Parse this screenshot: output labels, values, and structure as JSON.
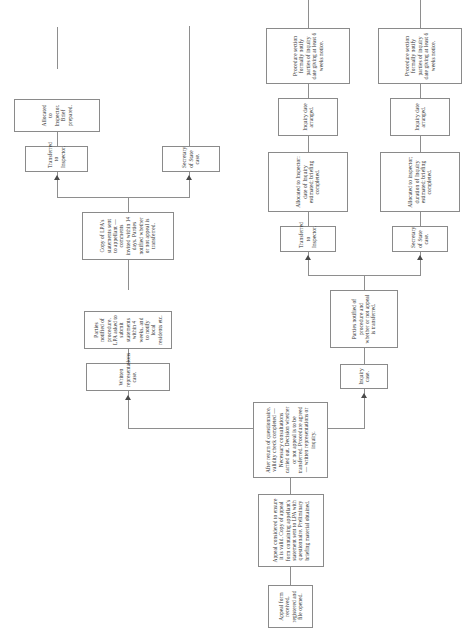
{
  "diagram": {
    "orientation": "landscape-rotated",
    "line_color": "#8e8e8e",
    "box_border_color": "#8a8a8a",
    "background": "#ffffff",
    "nodes": [
      {
        "id": "appeal-received",
        "text": "Appeal form received, registered and file opened."
      },
      {
        "id": "appeal-considered",
        "text": "Appeal considered to ensure it is valid. Copy of appeal form containing appellant's statement sent to LPA with questionnaire. Preliminary briefing material obtained."
      },
      {
        "id": "questionnaire-returned",
        "text": "After return of questionnaire, validity check completed — Necessary consultations carried out. Decision whether or not appeal is to be transferred. Procedure agreed — written representations or inquiry."
      },
      {
        "id": "written-reps-case",
        "text": "Written representations case."
      },
      {
        "id": "parties-notified-wr",
        "text": "Parties notified of procedure. LPA asked to submit statements within 4 weeks, and to notify local residents etc."
      },
      {
        "id": "copy-lpa-statements",
        "text": "Copy of LPA's statements sent to appellant — comments invited within 14 days. Parties notified whether or not appeal is transferred."
      },
      {
        "id": "transferred-inspector-wr",
        "text": "Transferred to Inspector."
      },
      {
        "id": "allocated-inspector-brief",
        "text": "Allocated to Inspector. Brief prepared."
      },
      {
        "id": "secretary-state-wr",
        "text": "Secretary of State case."
      },
      {
        "id": "inquiry-case",
        "text": "Inquiry case."
      },
      {
        "id": "parties-notified-inq",
        "text": "Parties notified of procedure and whether or not appeal is transferred."
      },
      {
        "id": "transferred-inspector-inq",
        "text": "Transferred to Inspector."
      },
      {
        "id": "allocated-inspector-date",
        "text": "Allocated to Inspector: date of Inquiry estimated; briefing completed."
      },
      {
        "id": "inquiry-date-arranged-top",
        "text": "Inquiry date arranged."
      },
      {
        "id": "procedure-section-top",
        "text": "Procedure section formally notify parties of inquiry date giving at least 6 weeks notice."
      },
      {
        "id": "secretary-state-inq",
        "text": "Secretary of State case."
      },
      {
        "id": "allocated-inspector-duration",
        "text": "Allocated to inspector; duration of Inquiry estimated; briefing completed."
      },
      {
        "id": "inquiry-date-arranged-bottom",
        "text": "Inquiry date arranged."
      },
      {
        "id": "procedure-section-bottom",
        "text": "Procedure section formally notify parties of inquiry date giving at least 6 weeks notice."
      }
    ]
  }
}
